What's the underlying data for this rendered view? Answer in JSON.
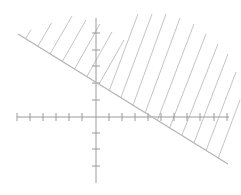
{
  "diagram": {
    "type": "linear-inequality-graph",
    "inequality": "x + 2y >= 4",
    "boundary_line": {
      "slope": -0.5,
      "y_intercept": 2,
      "x_intercept": 4,
      "style": "solid"
    },
    "shaded_region": "above-right of line",
    "x_axis": {
      "min_tick": -6,
      "max_tick": 10,
      "tick_step": 1
    },
    "y_axis": {
      "min_tick": -4,
      "max_tick": 5,
      "tick_step": 1
    },
    "colors": {
      "axis": "#9a9a9a",
      "line": "#b4b4b4",
      "hatch": "#c4c4c4",
      "background": "#ffffff"
    }
  }
}
